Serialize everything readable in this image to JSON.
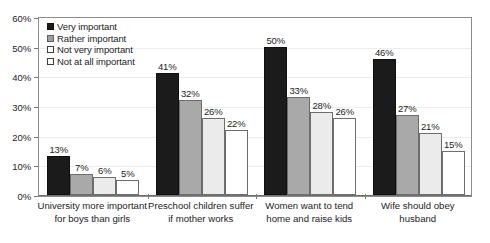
{
  "chart_data": {
    "type": "bar",
    "title": "",
    "xlabel": "",
    "ylabel": "",
    "ylim": [
      0,
      60
    ],
    "ytick_labels": [
      "0%",
      "10%",
      "20%",
      "30%",
      "40%",
      "50%",
      "60%"
    ],
    "ytick_values": [
      0,
      10,
      20,
      30,
      40,
      50,
      60
    ],
    "grid": true,
    "legend_position": "top-left inside plot",
    "value_suffix": "%",
    "categories": [
      "University more important for boys than girls",
      "Preschool children suffer if mother works",
      "Women want to tend home and raise kids",
      "Wife should obey husband"
    ],
    "category_lines": [
      [
        "University more important",
        "for boys than girls"
      ],
      [
        "Preschool children suffer",
        "if mother works"
      ],
      [
        "Women want to tend",
        "home and raise kids"
      ],
      [
        "Wife should obey",
        "husband"
      ]
    ],
    "series": [
      {
        "name": "Very important",
        "color": "#1b1b1b",
        "values": [
          13,
          41,
          50,
          46
        ],
        "labels": [
          "13%",
          "41%",
          "50%",
          "46%"
        ]
      },
      {
        "name": "Rather important",
        "color": "#a9a9a9",
        "values": [
          7,
          32,
          33,
          27
        ],
        "labels": [
          "7%",
          "32%",
          "33%",
          "27%"
        ]
      },
      {
        "name": "Not very important",
        "color": "#ebebeb",
        "values": [
          6,
          26,
          28,
          21
        ],
        "labels": [
          "6%",
          "26%",
          "28%",
          "21%"
        ]
      },
      {
        "name": "Not at all important",
        "color": "#ffffff",
        "values": [
          5,
          22,
          26,
          15
        ],
        "labels": [
          "5%",
          "22%",
          "26%",
          "15%"
        ]
      }
    ]
  },
  "legend": {
    "items": [
      {
        "label": "Very important"
      },
      {
        "label": "Rather important"
      },
      {
        "label": "Not very important"
      },
      {
        "label": "Not at all important"
      }
    ]
  }
}
